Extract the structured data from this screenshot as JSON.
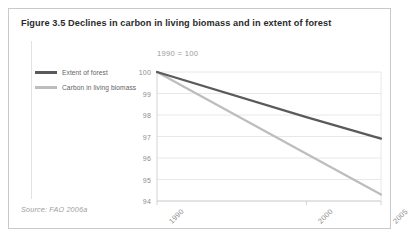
{
  "figure": {
    "title": "Figure 3.5 Declines in carbon in living biomass and in extent of forest",
    "source": "Source: FAO 2006a"
  },
  "legend": {
    "items": [
      {
        "label": "Extent of forest",
        "color": "#5a5a5a"
      },
      {
        "label": "Carbon in living biomass",
        "color": "#bdbdbd"
      }
    ]
  },
  "colors": {
    "card_border": "#c9c9c9",
    "gridline": "#e8e8e8",
    "axis": "#d2d2d2",
    "tick_text": "#8d8d8d",
    "title_text": "#2b2b2b",
    "source_text": "#9d9d9d",
    "extent_of_forest": "#5a5a5a",
    "carbon_in_living_biomass": "#bdbdbd"
  },
  "chart_data": {
    "type": "line",
    "title": "Figure 3.5 Declines in carbon in living biomass and in extent of forest",
    "subtitle": "1990 = 100",
    "xlabel": "",
    "ylabel": "",
    "x": [
      1990,
      2000,
      2005
    ],
    "xtick_labels": [
      "1990",
      "2000",
      "2005"
    ],
    "ytick_labels": [
      "100",
      "99",
      "98",
      "97",
      "96",
      "95",
      "94"
    ],
    "yticks": [
      100,
      99,
      98,
      97,
      96,
      95,
      94
    ],
    "ylim": [
      94,
      100
    ],
    "xlim": [
      1990,
      2005
    ],
    "grid": "horizontal",
    "legend_position": "left",
    "series": [
      {
        "name": "Extent of forest",
        "color": "#5a5a5a",
        "values": [
          100,
          97.9,
          96.9
        ]
      },
      {
        "name": "Carbon in living biomass",
        "color": "#bdbdbd",
        "values": [
          100,
          96.2,
          94.3
        ]
      }
    ]
  }
}
